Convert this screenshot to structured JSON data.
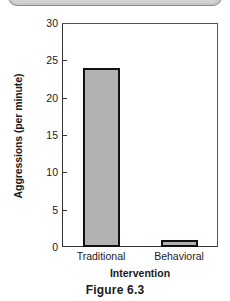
{
  "top_panel": {
    "name": "partial-rounded-panel"
  },
  "figure": {
    "caption": "Figure 6.3"
  },
  "chart_data": {
    "type": "bar",
    "title": "",
    "categories": [
      "Traditional",
      "Behavioral"
    ],
    "values": [
      24,
      1
    ],
    "series": [
      {
        "name": "Aggressions",
        "values": [
          24,
          1
        ]
      }
    ],
    "xlabel": "Intervention",
    "ylabel": "Aggressions (per minute)",
    "ylim": [
      0,
      30
    ],
    "ytick_values": [
      0,
      5,
      10,
      15,
      20,
      25,
      30
    ],
    "ytick_labels": [
      "0",
      "5",
      "10",
      "15",
      "20",
      "25",
      "30"
    ],
    "grid": false,
    "legend": false,
    "bar_fill_color": "#b2b2b2",
    "bar_edge_color": "#111111",
    "axis_color": "#333333",
    "plot_background": "#ffffff"
  }
}
